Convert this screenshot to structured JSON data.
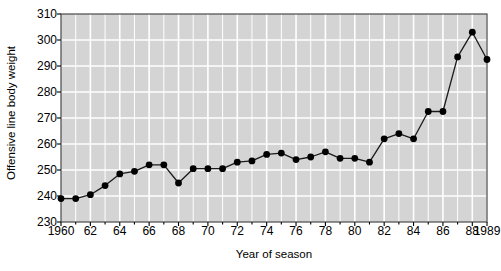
{
  "chart_data": {
    "type": "line",
    "title": "",
    "xlabel": "Year of season",
    "ylabel": "Offensive line body weight",
    "xlim": [
      1960,
      1989
    ],
    "ylim": [
      230,
      310
    ],
    "yticks": [
      230,
      240,
      250,
      260,
      270,
      280,
      290,
      300,
      310
    ],
    "xticks": [
      1960,
      1962,
      1964,
      1966,
      1968,
      1970,
      1972,
      1974,
      1976,
      1978,
      1980,
      1982,
      1984,
      1986,
      1988,
      1989
    ],
    "xtick_labels": [
      "1960",
      "62",
      "64",
      "66",
      "68",
      "70",
      "72",
      "74",
      "76",
      "78",
      "80",
      "82",
      "84",
      "86",
      "88",
      "1989"
    ],
    "grid": true,
    "legend": false,
    "marker": "filled-circle",
    "line_color": "#1a1a1a",
    "marker_color": "#000000",
    "plot_background": "#d4d4d4",
    "gridline_color": "#ffffff",
    "x": [
      1960,
      1961,
      1962,
      1963,
      1964,
      1965,
      1966,
      1967,
      1968,
      1969,
      1970,
      1971,
      1972,
      1973,
      1974,
      1975,
      1976,
      1977,
      1978,
      1979,
      1980,
      1981,
      1982,
      1983,
      1984,
      1985,
      1986,
      1987,
      1988,
      1989
    ],
    "values": [
      239,
      239,
      240.5,
      244,
      248.5,
      249.5,
      252,
      252,
      245,
      250.5,
      250.5,
      250.5,
      253,
      253.5,
      256,
      256.5,
      254,
      255,
      257,
      254.5,
      254.5,
      253,
      262,
      264,
      262,
      272.5,
      272.5,
      293.5,
      303,
      292.5
    ]
  },
  "axes": {
    "y_axis_title": "Offensive line body weight",
    "x_axis_title": "Year of season"
  }
}
